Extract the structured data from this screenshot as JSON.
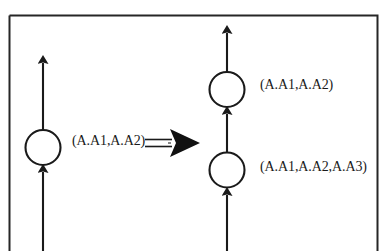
{
  "figure": {
    "kind": "graph-transformation-diagram",
    "border_color": "#262626",
    "stroke_color": "#1a1a1a",
    "background_color": "#ffffff"
  },
  "left_side": {
    "node_label": "(A.A1,A.A2)"
  },
  "transform_arrow": {
    "symbol": "double-shaft-arrow"
  },
  "right_side": {
    "top_node_label": "(A.A1,A.A2)",
    "bottom_node_label": "(A.A1,A.A2,A.A3)"
  }
}
